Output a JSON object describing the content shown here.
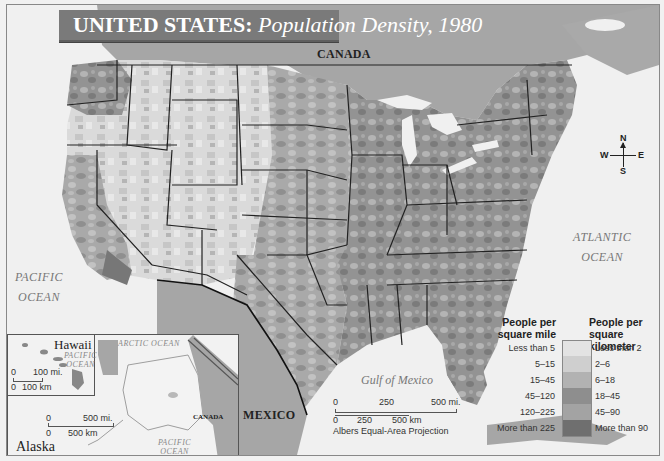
{
  "title": {
    "bold": "UNITED STATES:",
    "italic": "Population Density, 1980"
  },
  "labels": {
    "canada_top": "CANADA",
    "canada_inset": "CANADA",
    "mexico": "MEXICO",
    "pacific_ocean": [
      "PACIFIC",
      "OCEAN"
    ],
    "atlantic_ocean": [
      "ATLANTIC",
      "OCEAN"
    ],
    "gulf_of_mexico": "Gulf of Mexico",
    "arctic_ocean_inset": "ARCTIC  OCEAN",
    "pacific_ocean_hawaii": [
      "PACIFIC",
      "OCEAN"
    ],
    "pacific_ocean_alaska": [
      "PACIFIC",
      "OCEAN"
    ]
  },
  "compass": {
    "n": "N",
    "s": "S",
    "e": "E",
    "w": "W"
  },
  "legend": {
    "left_header": [
      "People per",
      "square mile"
    ],
    "right_header": [
      "People per",
      "square kilometer"
    ],
    "classes": [
      {
        "mile": "Less than 5",
        "km": "Less than 2",
        "color": "#e3e3e3"
      },
      {
        "mile": "5–15",
        "km": "2–6",
        "color": "#cfcfcf"
      },
      {
        "mile": "15–45",
        "km": "6–18",
        "color": "#b2b2b2"
      },
      {
        "mile": "45–120",
        "km": "18–45",
        "color": "#8e8e8e"
      },
      {
        "mile": "120–225",
        "km": "45–90",
        "color": "#a3a3a3"
      },
      {
        "mile": "More than 225",
        "km": "More than 90",
        "color": "#6f6f6f"
      }
    ]
  },
  "main_scale": {
    "mi_ticks": [
      "0",
      "250",
      "500 mi."
    ],
    "km_ticks": [
      "0",
      "250",
      "500 km"
    ],
    "projection": "Albers Equal-Area Projection"
  },
  "hawaii_inset": {
    "title": "Hawaii",
    "scale_mi": [
      "0",
      "100 mi."
    ],
    "scale_km": [
      "0",
      "100 km"
    ]
  },
  "alaska_inset": {
    "title": "Alaska",
    "scale_mi": [
      "0",
      "500 mi."
    ],
    "scale_km": [
      "0",
      "500 km"
    ]
  },
  "colors": {
    "water": "#f0f0f0",
    "foreign_land": "#a9a9a9",
    "title_bar": "#7a7a7a",
    "border": "#222222"
  }
}
